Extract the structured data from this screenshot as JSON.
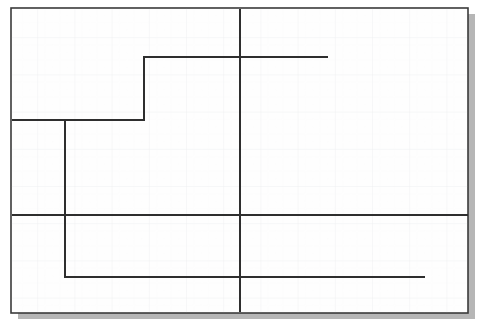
{
  "document": {
    "type": "scanned-technical-drawing",
    "title": "Scanned graph-paper line drawing",
    "page_width": 484,
    "page_height": 334,
    "background_color": "#ffffff"
  },
  "sheet": {
    "name": "graph-paper-sheet",
    "x": 11,
    "y": 8,
    "width": 457,
    "height": 305,
    "fill_color": "#fefefe",
    "border_color": "#3a3a3a",
    "border_width": 1.6,
    "shadow": {
      "color": "#a8a8a8",
      "offset_x": 7,
      "offset_y": 6,
      "opacity": 0.85
    }
  },
  "grid": {
    "name": "graph-paper-grid",
    "visible": true,
    "spacing_px": 37.2,
    "line_color": "#f0f0f2",
    "line_width": 0.9,
    "minor_spacing_px": 7.44,
    "minor_line_color": "#fafafb",
    "minor_line_width": 0.5
  },
  "ink": {
    "color": "#2e2e2e",
    "width": 2.0,
    "cap": "butt",
    "join": "miter"
  },
  "strokes": [
    {
      "name": "stepped-profile-polyline",
      "label": "Upper stepped profile",
      "kind": "polyline",
      "points": [
        [
          12,
          120
        ],
        [
          65,
          120
        ],
        [
          65,
          120
        ],
        [
          144,
          120
        ],
        [
          144,
          57
        ],
        [
          328,
          57
        ]
      ]
    },
    {
      "name": "lower-stepped-polyline",
      "label": "Lower stepped profile",
      "kind": "polyline",
      "points": [
        [
          65,
          120
        ],
        [
          65,
          277
        ],
        [
          425,
          277
        ]
      ]
    },
    {
      "name": "horizontal-axis-line",
      "label": "Full-width horizontal reference line",
      "kind": "line",
      "points": [
        [
          12,
          215
        ],
        [
          468,
          215
        ]
      ]
    },
    {
      "name": "vertical-axis-line",
      "label": "Full-height vertical reference line",
      "kind": "line",
      "points": [
        [
          240,
          9
        ],
        [
          240,
          312
        ]
      ]
    }
  ],
  "annotations": {
    "vertices": [
      {
        "name": "vertex-left-shoulder",
        "x": 65,
        "y": 120
      },
      {
        "name": "vertex-inner-step",
        "x": 144,
        "y": 120
      },
      {
        "name": "vertex-top-step",
        "x": 144,
        "y": 57
      },
      {
        "name": "vertex-top-end",
        "x": 328,
        "y": 57
      },
      {
        "name": "vertex-bottom-corner",
        "x": 65,
        "y": 277
      },
      {
        "name": "vertex-bottom-end",
        "x": 425,
        "y": 277
      },
      {
        "name": "vertex-axes-crossing",
        "x": 240,
        "y": 215
      }
    ],
    "labels": []
  }
}
